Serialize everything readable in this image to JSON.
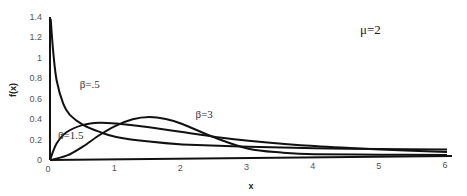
{
  "chart_data": {
    "type": "line",
    "title": "",
    "xlabel": "x",
    "ylabel": "f(x)",
    "xlim": [
      0,
      6
    ],
    "ylim": [
      0,
      1.4
    ],
    "x_ticks": [
      "0",
      "1",
      "2",
      "3",
      "4",
      "5",
      "6"
    ],
    "y_ticks": [
      "0",
      "0.2",
      "0.4",
      "0.6",
      "0.8",
      "1",
      "1.2",
      "1.4"
    ],
    "grid": false,
    "legend": null,
    "parameter_label": "μ=2",
    "series": [
      {
        "name": "β=.5",
        "label_pos": [
          0.45,
          0.7
        ],
        "x": [
          0.01,
          0.05,
          0.1,
          0.2,
          0.3,
          0.5,
          0.75,
          1,
          1.5,
          2,
          3,
          4,
          5,
          6
        ],
        "values": [
          1.38,
          1.05,
          0.78,
          0.55,
          0.44,
          0.34,
          0.27,
          0.22,
          0.17,
          0.14,
          0.11,
          0.09,
          0.075,
          0.065
        ]
      },
      {
        "name": "β=1.5",
        "label_pos": [
          0.12,
          0.2
        ],
        "x": [
          0,
          0.1,
          0.25,
          0.5,
          0.75,
          1,
          1.5,
          2,
          2.5,
          3,
          4,
          5,
          6
        ],
        "values": [
          0,
          0.16,
          0.27,
          0.34,
          0.36,
          0.35,
          0.31,
          0.26,
          0.21,
          0.17,
          0.11,
          0.07,
          0.04
        ]
      },
      {
        "name": "β=3",
        "label_pos": [
          2.2,
          0.4
        ],
        "x": [
          0,
          0.25,
          0.5,
          0.75,
          1,
          1.25,
          1.5,
          1.75,
          2,
          2.5,
          3,
          3.5,
          4,
          5,
          6
        ],
        "values": [
          0,
          0.04,
          0.13,
          0.24,
          0.33,
          0.39,
          0.41,
          0.39,
          0.34,
          0.2,
          0.09,
          0.05,
          0.03,
          0.02,
          0.01
        ]
      }
    ]
  }
}
